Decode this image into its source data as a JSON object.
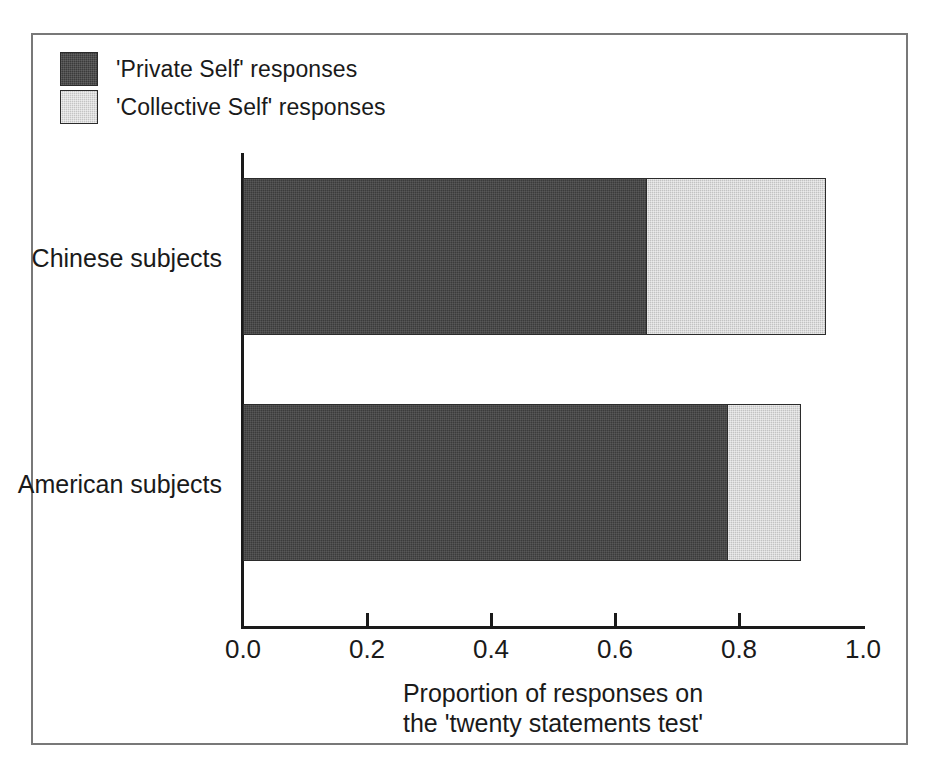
{
  "chart_data": {
    "type": "bar",
    "orientation": "horizontal",
    "stacked": true,
    "title": "",
    "xlabel_line1": "Proportion of responses on",
    "xlabel_line2": "the 'twenty statements test'",
    "ylabel": "",
    "categories": [
      "Chinese subjects",
      "American subjects"
    ],
    "series": [
      {
        "name": "'Private Self' responses",
        "color": "#3b3b3b",
        "values": [
          0.65,
          0.78
        ]
      },
      {
        "name": "'Collective Self' responses",
        "color": "#c2c2c2",
        "values": [
          0.29,
          0.12
        ]
      }
    ],
    "totals": [
      0.94,
      0.9
    ],
    "xlim": [
      0.0,
      1.0
    ],
    "xticks": [
      0.0,
      0.2,
      0.4,
      0.6,
      0.8,
      1.0
    ],
    "xtick_labels": [
      "0.0",
      "0.2",
      "0.4",
      "0.6",
      "0.8",
      "1.0"
    ],
    "grid": false,
    "legend_position": "top-left",
    "frame": true
  },
  "legend": {
    "items": [
      {
        "label": "'Private Self' responses",
        "swatch": "dark"
      },
      {
        "label": "'Collective Self' responses",
        "swatch": "light"
      }
    ]
  },
  "axis": {
    "tick_labels": [
      "0.0",
      "0.2",
      "0.4",
      "0.6",
      "0.8",
      "1.0"
    ],
    "title_line1": "Proportion of responses on",
    "title_line2": "the 'twenty statements test'"
  },
  "categories": {
    "items": [
      "Chinese subjects",
      "American subjects"
    ]
  },
  "colors": {
    "private_self": "#3b3b3b",
    "collective_self": "#c2c2c2",
    "axis": "#1a1a1a",
    "frame": "#787878",
    "background": "#ffffff"
  }
}
